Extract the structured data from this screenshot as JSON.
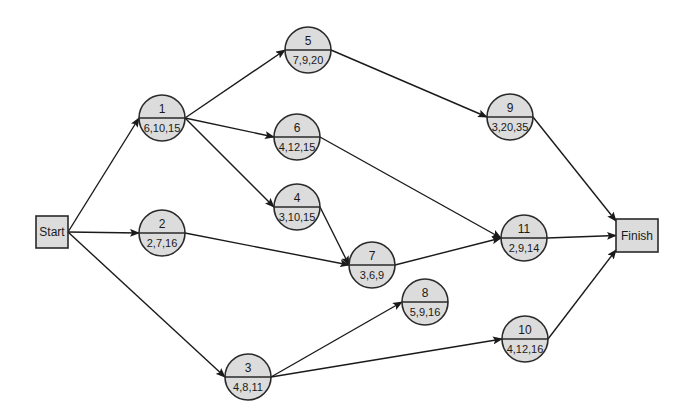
{
  "diagram": {
    "type": "activity-network",
    "terminals": {
      "start": {
        "label": "Start",
        "x": 36,
        "y": 216,
        "w": 32,
        "h": 32
      },
      "finish": {
        "label": "Finish",
        "x": 616,
        "y": 219,
        "w": 42,
        "h": 33
      }
    },
    "radius": 23,
    "nodes": [
      {
        "id": "1",
        "estimates": "6,10,15",
        "cx": 162,
        "cy": 118
      },
      {
        "id": "2",
        "estimates": "2,7,16",
        "cx": 162,
        "cy": 233
      },
      {
        "id": "3",
        "estimates": "4,8,11",
        "cx": 248,
        "cy": 377
      },
      {
        "id": "4",
        "estimates": "3,10,15",
        "cx": 297,
        "cy": 207
      },
      {
        "id": "5",
        "estimates": "7,9,20",
        "cx": 308,
        "cy": 50
      },
      {
        "id": "6",
        "estimates": "4,12,15",
        "cx": 297,
        "cy": 137
      },
      {
        "id": "7",
        "estimates": "3,6,9",
        "cx": 372,
        "cy": 265
      },
      {
        "id": "8",
        "estimates": "5,9,16",
        "cx": 425,
        "cy": 302
      },
      {
        "id": "9",
        "estimates": "3,20,35",
        "cx": 510,
        "cy": 117
      },
      {
        "id": "10",
        "estimates": "4,12,16",
        "cx": 525,
        "cy": 339
      },
      {
        "id": "11",
        "estimates": "2,9,14",
        "cx": 524,
        "cy": 238
      }
    ],
    "edges": [
      {
        "from": "Start",
        "to": "1"
      },
      {
        "from": "Start",
        "to": "2"
      },
      {
        "from": "Start",
        "to": "3"
      },
      {
        "from": "1",
        "to": "5"
      },
      {
        "from": "1",
        "to": "6"
      },
      {
        "from": "1",
        "to": "4"
      },
      {
        "from": "2",
        "to": "7"
      },
      {
        "from": "4",
        "to": "7"
      },
      {
        "from": "5",
        "to": "9"
      },
      {
        "from": "6",
        "to": "11"
      },
      {
        "from": "7",
        "to": "11"
      },
      {
        "from": "3",
        "to": "8"
      },
      {
        "from": "3",
        "to": "10"
      },
      {
        "from": "9",
        "to": "Finish"
      },
      {
        "from": "11",
        "to": "Finish"
      },
      {
        "from": "10",
        "to": "Finish"
      }
    ]
  },
  "colors": {
    "node_fill": "#dcdcdc",
    "stroke": "#2a2a2a",
    "background": "#ffffff"
  }
}
